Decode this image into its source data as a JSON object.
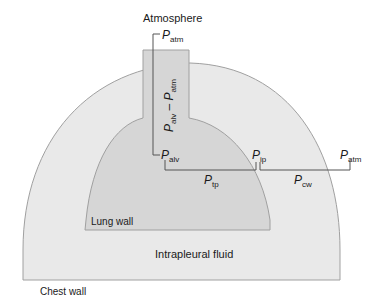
{
  "labels": {
    "atmosphere": "Atmosphere",
    "chest_wall": "Chest wall",
    "lung_wall": "Lung wall",
    "intrapleural_fluid": "Intrapleural fluid"
  },
  "pressures": {
    "p_atm_top": {
      "main": "P",
      "sub": "atm"
    },
    "p_alv": {
      "main": "P",
      "sub": "alv"
    },
    "p_ip": {
      "main": "P",
      "sub": "ip"
    },
    "p_atm_right": {
      "main": "P",
      "sub": "atm"
    },
    "p_tp": {
      "main": "P",
      "sub": "tp"
    },
    "p_cw": {
      "main": "P",
      "sub": "cw"
    },
    "vertical_expr": {
      "p1": "P",
      "s1": "alv",
      "minus": " – ",
      "p2": "P",
      "s2": "atm"
    }
  },
  "colors": {
    "chest_fill": "#e9e9e9",
    "lung_fill": "#d6d6d6",
    "outline": "#a0a0a0",
    "bracket": "#555555"
  }
}
